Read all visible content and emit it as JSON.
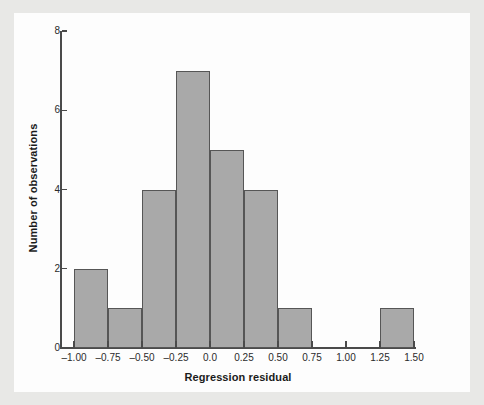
{
  "chart_data": {
    "type": "bar",
    "subtype": "histogram",
    "title": "",
    "xlabel": "Regression residual",
    "ylabel": "Number of observations",
    "xlim": [
      -1.0,
      1.5
    ],
    "ylim": [
      0,
      8
    ],
    "bin_width": 0.25,
    "grid": false,
    "legend": null,
    "bar_fill_color": "#a9a9a9",
    "bar_edge_color": "#565656",
    "axis_color": "#4a4a4a",
    "panel_background": "#fdfdfd",
    "page_background": "#e8e8e6",
    "x_ticks": [
      -1.0,
      -0.75,
      -0.5,
      -0.25,
      0.0,
      0.25,
      0.5,
      0.75,
      1.0,
      1.25,
      1.5
    ],
    "x_tick_labels": [
      "–1.00",
      "–0.75",
      "–0.50",
      "–0.25",
      "0.0",
      "0.25",
      "0.50",
      "0.75",
      "1.00",
      "1.25",
      "1.50"
    ],
    "y_ticks": [
      0,
      2,
      4,
      6,
      8
    ],
    "y_tick_labels": [
      "0",
      "2",
      "4",
      "6",
      "8"
    ],
    "bins": [
      {
        "left": -1.0,
        "right": -0.75,
        "count": 2
      },
      {
        "left": -0.75,
        "right": -0.5,
        "count": 1
      },
      {
        "left": -0.5,
        "right": -0.25,
        "count": 4
      },
      {
        "left": -0.25,
        "right": 0.0,
        "count": 7
      },
      {
        "left": 0.0,
        "right": 0.25,
        "count": 5
      },
      {
        "left": 0.25,
        "right": 0.5,
        "count": 4
      },
      {
        "left": 0.5,
        "right": 0.75,
        "count": 1
      },
      {
        "left": 0.75,
        "right": 1.0,
        "count": 0
      },
      {
        "left": 1.0,
        "right": 1.25,
        "count": 0
      },
      {
        "left": 1.25,
        "right": 1.5,
        "count": 1
      }
    ],
    "categories": [
      "-1.00 to -0.75",
      "-0.75 to -0.50",
      "-0.50 to -0.25",
      "-0.25 to 0.00",
      "0.00 to 0.25",
      "0.25 to 0.50",
      "0.50 to 0.75",
      "0.75 to 1.00",
      "1.00 to 1.25",
      "1.25 to 1.50"
    ],
    "values": [
      2,
      1,
      4,
      7,
      5,
      4,
      1,
      0,
      0,
      1
    ],
    "total_observations": 25
  }
}
